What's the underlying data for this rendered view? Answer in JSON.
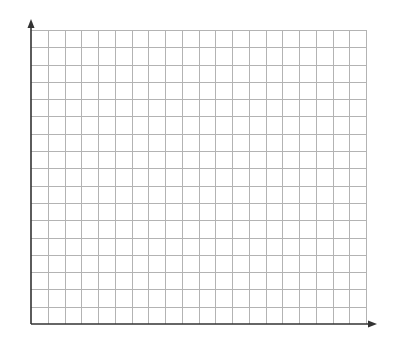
{
  "diagram": {
    "type": "blank-coordinate-grid",
    "background_color": "#ffffff",
    "grid": {
      "columns": 20,
      "rows": 17,
      "left": 31,
      "top": 30,
      "right": 366,
      "bottom": 324,
      "line_color": "#b3b3b3",
      "line_width": 1
    },
    "axes": {
      "color": "#333333",
      "line_width": 1.6,
      "origin": [
        31,
        324
      ],
      "x_axis": {
        "end_x": 377,
        "arrow": true,
        "label": ""
      },
      "y_axis": {
        "end_y": 19,
        "arrow": true,
        "label": ""
      }
    }
  }
}
